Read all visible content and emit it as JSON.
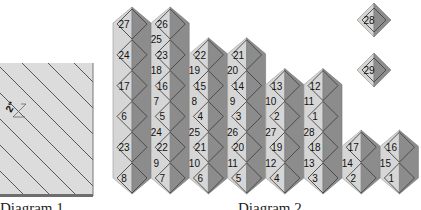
{
  "diagram1": {
    "caption": "Diagram 1",
    "measure_label": "2\""
  },
  "diagram2": {
    "caption": "Diagram 2",
    "colors": {
      "light": "#d6d6d6",
      "dark": "#8c8c8c",
      "outline": "#444444",
      "panel": "#dcdcdc"
    },
    "columns": [
      {
        "start_slot": 0,
        "labels": [
          {
            "slot": 0,
            "text": "27"
          },
          {
            "slot": 2,
            "text": "24"
          },
          {
            "slot": 4,
            "text": "17"
          },
          {
            "slot": 6,
            "text": "6"
          },
          {
            "slot": 8,
            "text": "23"
          },
          {
            "slot": 10,
            "text": "8"
          }
        ]
      },
      {
        "start_slot": 0,
        "labels": [
          {
            "slot": 0,
            "text": "26"
          },
          {
            "slot": 1,
            "text": "25"
          },
          {
            "slot": 2,
            "text": "23"
          },
          {
            "slot": 3,
            "text": "18"
          },
          {
            "slot": 4,
            "text": "16"
          },
          {
            "slot": 5,
            "text": "7"
          },
          {
            "slot": 6,
            "text": "5"
          },
          {
            "slot": 7,
            "text": "24"
          },
          {
            "slot": 8,
            "text": "22"
          },
          {
            "slot": 9,
            "text": "9"
          },
          {
            "slot": 10,
            "text": "7"
          }
        ]
      },
      {
        "start_slot": 2,
        "labels": [
          {
            "slot": 2,
            "text": "22"
          },
          {
            "slot": 3,
            "text": "19"
          },
          {
            "slot": 4,
            "text": "15"
          },
          {
            "slot": 5,
            "text": "8"
          },
          {
            "slot": 6,
            "text": "4"
          },
          {
            "slot": 7,
            "text": "25"
          },
          {
            "slot": 8,
            "text": "21"
          },
          {
            "slot": 9,
            "text": "10"
          },
          {
            "slot": 10,
            "text": "6"
          }
        ]
      },
      {
        "start_slot": 2,
        "labels": [
          {
            "slot": 2,
            "text": "21"
          },
          {
            "slot": 3,
            "text": "20"
          },
          {
            "slot": 4,
            "text": "14"
          },
          {
            "slot": 5,
            "text": "9"
          },
          {
            "slot": 6,
            "text": "3"
          },
          {
            "slot": 7,
            "text": "26"
          },
          {
            "slot": 8,
            "text": "20"
          },
          {
            "slot": 9,
            "text": "11"
          },
          {
            "slot": 10,
            "text": "5"
          }
        ]
      },
      {
        "start_slot": 4,
        "labels": [
          {
            "slot": 4,
            "text": "13"
          },
          {
            "slot": 5,
            "text": "10"
          },
          {
            "slot": 6,
            "text": "2"
          },
          {
            "slot": 7,
            "text": "27"
          },
          {
            "slot": 8,
            "text": "19"
          },
          {
            "slot": 9,
            "text": "12"
          },
          {
            "slot": 10,
            "text": "4"
          }
        ]
      },
      {
        "start_slot": 4,
        "labels": [
          {
            "slot": 4,
            "text": "12"
          },
          {
            "slot": 5,
            "text": "11"
          },
          {
            "slot": 6,
            "text": "1"
          },
          {
            "slot": 7,
            "text": "28"
          },
          {
            "slot": 8,
            "text": "18"
          },
          {
            "slot": 9,
            "text": "13"
          },
          {
            "slot": 10,
            "text": "3"
          }
        ]
      },
      {
        "start_slot": 8,
        "labels": [
          {
            "slot": 8,
            "text": "17"
          },
          {
            "slot": 9,
            "text": "14"
          },
          {
            "slot": 10,
            "text": "2"
          }
        ]
      },
      {
        "start_slot": 8,
        "labels": [
          {
            "slot": 8,
            "text": "16"
          },
          {
            "slot": 9,
            "text": "15"
          },
          {
            "slot": 10,
            "text": "1"
          }
        ]
      }
    ],
    "loose_squares": [
      {
        "text": "28"
      },
      {
        "text": "29"
      }
    ]
  }
}
